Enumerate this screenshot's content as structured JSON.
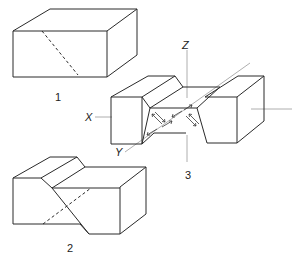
{
  "figure": {
    "panels": [
      {
        "id": "1",
        "label": "1",
        "description": "rectangular block with dashed diagonal plane"
      },
      {
        "id": "2",
        "label": "2",
        "description": "block offset along inclined plane (stepped)"
      },
      {
        "id": "3",
        "label": "3",
        "description": "block with V-shaped channel and shear arrows, with axes"
      }
    ],
    "axes": {
      "x": "X",
      "y": "Y",
      "z": "Z"
    },
    "colors": {
      "line": "#2a2a2a",
      "axis": "#9a9a9a",
      "background": "#ffffff"
    }
  }
}
